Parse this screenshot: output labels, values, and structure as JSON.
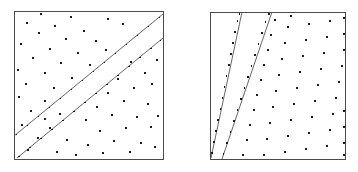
{
  "figure": {
    "background_color": "#ffffff",
    "width": 358,
    "height": 172,
    "frame_color": "#4a4a4a",
    "line_color": "#555555",
    "dot_color": "#1c1c1c",
    "dot_size": 1.6
  },
  "panels": [
    {
      "id": "left-panel",
      "label": "left panel",
      "frame": {
        "x": 14,
        "y": 11,
        "width": 149,
        "height": 148
      },
      "lines": [
        {
          "name": "upper-diagonal-line",
          "x1": 14,
          "y1": 136,
          "x2": 163,
          "y2": 14,
          "slope_description": "shallow positive diagonal, about 45 degrees"
        },
        {
          "name": "lower-diagonal-line",
          "x1": 17,
          "y1": 158,
          "x2": 163,
          "y2": 38,
          "slope_description": "parallel to the upper diagonal line"
        }
      ],
      "line_dots": [
        [
          16.5,
          134.5
        ],
        [
          27.5,
          125.5
        ],
        [
          38.5,
          116.5
        ],
        [
          49.5,
          107.5
        ],
        [
          60.5,
          98.5
        ],
        [
          71.5,
          89.5
        ],
        [
          82.5,
          80.5
        ],
        [
          93.5,
          71.5
        ],
        [
          104.5,
          62.5
        ],
        [
          115.5,
          53.5
        ],
        [
          126.5,
          44.5
        ],
        [
          137.5,
          35.5
        ],
        [
          148.5,
          26.5
        ],
        [
          159.5,
          17.5
        ],
        [
          19.0,
          156.5
        ],
        [
          30.0,
          147.5
        ],
        [
          41.0,
          138.5
        ],
        [
          52.0,
          129.5
        ],
        [
          63.0,
          120.5
        ],
        [
          74.0,
          111.5
        ],
        [
          85.0,
          102.5
        ],
        [
          96.0,
          93.5
        ],
        [
          107.0,
          84.5
        ],
        [
          118.0,
          75.5
        ],
        [
          129.0,
          66.5
        ],
        [
          140.0,
          57.5
        ],
        [
          151.0,
          48.5
        ],
        [
          160.5,
          40.5
        ]
      ],
      "scatter_dots": [
        [
          41.0,
          14.0
        ],
        [
          71.0,
          17.0
        ],
        [
          108.0,
          19.0
        ],
        [
          27.0,
          23.0
        ],
        [
          55.0,
          26.0
        ],
        [
          84.0,
          31.0
        ],
        [
          123.0,
          24.0
        ],
        [
          39.0,
          33.0
        ],
        [
          66.0,
          39.0
        ],
        [
          96.0,
          41.0
        ],
        [
          21.0,
          44.0
        ],
        [
          50.0,
          49.0
        ],
        [
          78.0,
          53.0
        ],
        [
          106.0,
          50.0
        ],
        [
          33.0,
          58.0
        ],
        [
          61.0,
          63.0
        ],
        [
          90.0,
          65.0
        ],
        [
          18.0,
          70.0
        ],
        [
          45.0,
          73.0
        ],
        [
          72.0,
          78.0
        ],
        [
          131.0,
          62.0
        ],
        [
          145.0,
          73.0
        ],
        [
          118.0,
          79.0
        ],
        [
          26.0,
          84.0
        ],
        [
          54.0,
          88.0
        ],
        [
          134.0,
          88.0
        ],
        [
          152.0,
          84.0
        ],
        [
          108.0,
          93.0
        ],
        [
          19.0,
          97.0
        ],
        [
          45.0,
          101.0
        ],
        [
          124.0,
          101.0
        ],
        [
          148.0,
          104.0
        ],
        [
          97.0,
          107.0
        ],
        [
          31.0,
          111.0
        ],
        [
          60.0,
          114.0
        ],
        [
          112.0,
          115.0
        ],
        [
          137.0,
          117.0
        ],
        [
          86.0,
          120.0
        ],
        [
          22.0,
          125.0
        ],
        [
          50.0,
          128.0
        ],
        [
          126.0,
          128.0
        ],
        [
          151.0,
          127.0
        ],
        [
          100.0,
          131.0
        ],
        [
          38.0,
          138.0
        ],
        [
          67.0,
          140.0
        ],
        [
          114.0,
          141.0
        ],
        [
          141.0,
          143.0
        ],
        [
          88.0,
          145.0
        ],
        [
          28.0,
          150.0
        ],
        [
          57.0,
          152.0
        ],
        [
          103.0,
          153.0
        ],
        [
          130.0,
          152.0
        ],
        [
          155.0,
          147.0
        ],
        [
          76.0,
          155.0
        ],
        [
          45.0,
          119.0
        ],
        [
          157.0,
          60.0
        ],
        [
          158.0,
          116.0
        ]
      ]
    },
    {
      "id": "right-panel",
      "label": "right panel",
      "frame": {
        "x": 210,
        "y": 12,
        "width": 135,
        "height": 147
      },
      "lines": [
        {
          "name": "left-steep-line",
          "x1": 211,
          "y1": 158,
          "x2": 242,
          "y2": 12,
          "slope_description": "steep positive slope rising to the right"
        },
        {
          "name": "right-steep-line",
          "x1": 222,
          "y1": 159,
          "x2": 272,
          "y2": 12,
          "slope_description": "parallel steep line offset to the right"
        }
      ],
      "line_dots": [
        [
          212.0,
          153.0
        ],
        [
          214.0,
          142.0
        ],
        [
          216.0,
          131.0
        ],
        [
          218.0,
          120.0
        ],
        [
          220.5,
          109.0
        ],
        [
          222.5,
          98.0
        ],
        [
          224.5,
          87.0
        ],
        [
          226.5,
          76.0
        ],
        [
          229.0,
          65.0
        ],
        [
          231.0,
          54.0
        ],
        [
          233.0,
          43.0
        ],
        [
          235.0,
          32.0
        ],
        [
          237.5,
          21.0
        ],
        [
          239.5,
          14.0
        ],
        [
          223.5,
          154.0
        ],
        [
          227.0,
          143.0
        ],
        [
          230.5,
          132.0
        ],
        [
          234.0,
          121.0
        ],
        [
          237.5,
          110.0
        ],
        [
          241.0,
          99.0
        ],
        [
          244.5,
          88.0
        ],
        [
          248.0,
          77.0
        ],
        [
          251.5,
          66.0
        ],
        [
          255.0,
          55.0
        ],
        [
          258.5,
          44.0
        ],
        [
          262.0,
          33.0
        ],
        [
          265.5,
          22.0
        ],
        [
          269.0,
          14.0
        ]
      ],
      "scatter_dots": [
        [
          264.0,
          155.0
        ],
        [
          267.0,
          139.0
        ],
        [
          270.0,
          123.0
        ],
        [
          273.0,
          107.0
        ],
        [
          276.0,
          91.0
        ],
        [
          279.0,
          75.0
        ],
        [
          282.0,
          59.0
        ],
        [
          285.0,
          43.0
        ],
        [
          288.0,
          27.0
        ],
        [
          291.0,
          16.0
        ],
        [
          285.0,
          152.0
        ],
        [
          288.0,
          136.0
        ],
        [
          291.0,
          120.0
        ],
        [
          294.0,
          104.0
        ],
        [
          297.0,
          88.0
        ],
        [
          300.0,
          72.0
        ],
        [
          303.0,
          56.0
        ],
        [
          306.0,
          40.0
        ],
        [
          309.0,
          24.0
        ],
        [
          306.0,
          149.0
        ],
        [
          309.0,
          133.0
        ],
        [
          312.0,
          117.0
        ],
        [
          315.0,
          101.0
        ],
        [
          318.0,
          85.0
        ],
        [
          321.0,
          69.0
        ],
        [
          324.0,
          53.0
        ],
        [
          327.0,
          37.0
        ],
        [
          330.0,
          21.0
        ],
        [
          327.0,
          146.0
        ],
        [
          330.0,
          130.0
        ],
        [
          333.0,
          114.0
        ],
        [
          336.0,
          98.0
        ],
        [
          339.0,
          82.0
        ],
        [
          342.0,
          66.0
        ],
        [
          344.0,
          50.0
        ],
        [
          344.0,
          34.0
        ],
        [
          344.0,
          18.0
        ],
        [
          344.0,
          155.0
        ],
        [
          344.0,
          143.0
        ],
        [
          344.0,
          127.0
        ],
        [
          344.0,
          111.0
        ],
        [
          243.0,
          155.0
        ],
        [
          247.0,
          140.0
        ],
        [
          250.0,
          125.0
        ],
        [
          254.0,
          110.0
        ],
        [
          257.0,
          95.0
        ],
        [
          261.0,
          80.0
        ],
        [
          264.0,
          65.0
        ],
        [
          268.0,
          50.0
        ],
        [
          271.0,
          35.0
        ],
        [
          275.0,
          20.0
        ]
      ]
    }
  ]
}
